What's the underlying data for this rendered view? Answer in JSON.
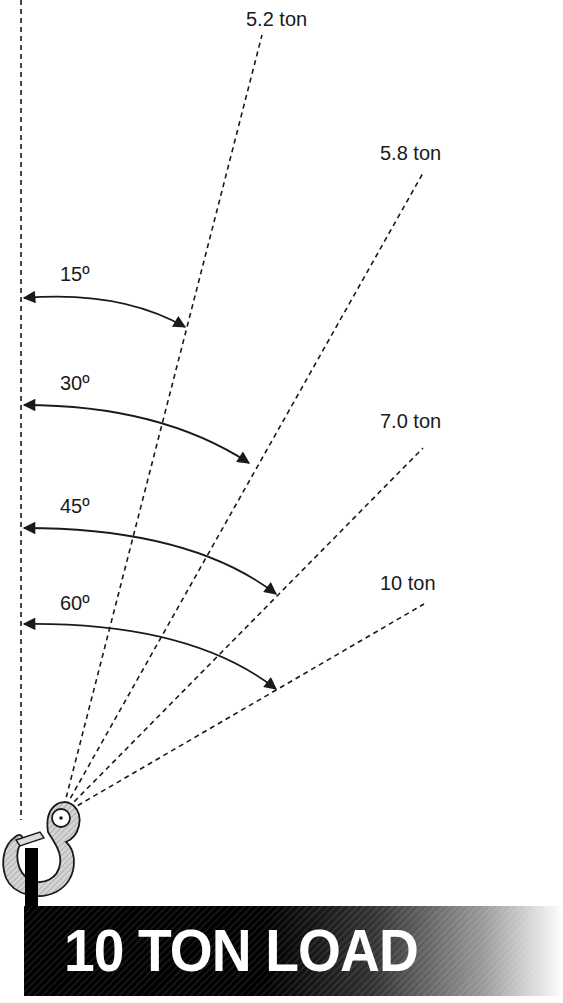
{
  "diagram": {
    "load_label": "10 TON LOAD",
    "legs": [
      {
        "angle_label": "15º",
        "tension_label": "5.2 ton"
      },
      {
        "angle_label": "30º",
        "tension_label": "5.8 ton"
      },
      {
        "angle_label": "45º",
        "tension_label": "7.0 ton"
      },
      {
        "angle_label": "60º",
        "tension_label": "10 ton"
      }
    ],
    "colors": {
      "line": "#1a1a1a",
      "hook_fill": "#d0d0d0",
      "banner_start": "#000000",
      "banner_end": "#ffffff",
      "banner_text": "#ffffff"
    }
  }
}
